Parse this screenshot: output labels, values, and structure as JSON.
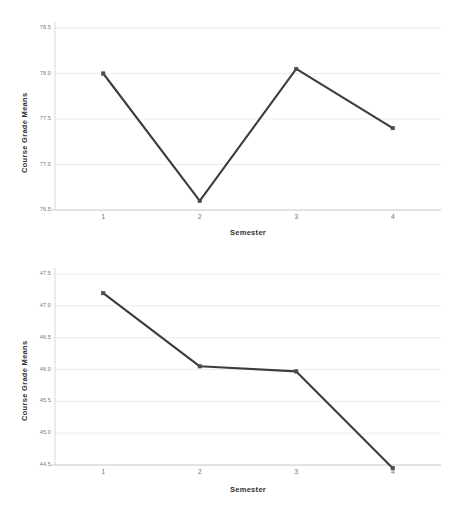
{
  "figure": {
    "background": "#ffffff",
    "line_color": "#3d3d3d",
    "marker_color": "#4a4a4a",
    "gridline_color": "#ececec",
    "axis_color": "#d9d9d9"
  },
  "chart_data": [
    {
      "type": "line",
      "id": "top",
      "title": "",
      "xlabel": "Semester",
      "ylabel": "Course Grade Means",
      "categories": [
        "1",
        "2",
        "3",
        "4"
      ],
      "x": [
        1,
        2,
        3,
        4
      ],
      "values": [
        78.0,
        76.6,
        78.05,
        77.4
      ],
      "yticks": [
        "78.5",
        "78.0",
        "77.5",
        "77.0",
        "76.5"
      ],
      "ytick_values": [
        78.5,
        78.0,
        77.5,
        77.0,
        76.5
      ],
      "xticks": [
        "1",
        "2",
        "3",
        "4"
      ],
      "ylim": [
        76.5,
        78.5
      ],
      "xlim": [
        0.5,
        4.5
      ],
      "grid": true,
      "legend": "none",
      "markers": true
    },
    {
      "type": "line",
      "id": "bottom",
      "title": "",
      "xlabel": "Semester",
      "ylabel": "Course Grade Means",
      "categories": [
        "1",
        "2",
        "3",
        "4"
      ],
      "x": [
        1,
        2,
        3,
        4
      ],
      "values": [
        47.2,
        46.05,
        45.97,
        44.45
      ],
      "yticks": [
        "47.5",
        "47.0",
        "46.5",
        "46.0",
        "45.5",
        "45.0",
        "44.5"
      ],
      "ytick_values": [
        47.5,
        47.0,
        46.5,
        46.0,
        45.5,
        45.0,
        44.5
      ],
      "xticks": [
        "1",
        "2",
        "3",
        "4"
      ],
      "ylim": [
        44.5,
        47.5
      ],
      "xlim": [
        0.5,
        4.5
      ],
      "grid": true,
      "legend": "none",
      "markers": true
    }
  ]
}
